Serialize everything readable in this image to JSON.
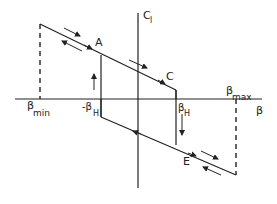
{
  "diagram": {
    "type": "hysteresis-loop",
    "axes": {
      "x_label": "β",
      "y_label": "C",
      "y_label_sub": "l"
    },
    "labels": {
      "A": "A",
      "C": "C",
      "E": "E",
      "beta_min": "β",
      "beta_min_sub": "min",
      "beta_max": "β",
      "beta_max_sub": "max",
      "neg_beta_h": "-β",
      "neg_beta_h_sub": "H",
      "beta_h": "β",
      "beta_h_sub": "H"
    },
    "colors": {
      "line": "#222222",
      "background": "#ffffff"
    }
  }
}
